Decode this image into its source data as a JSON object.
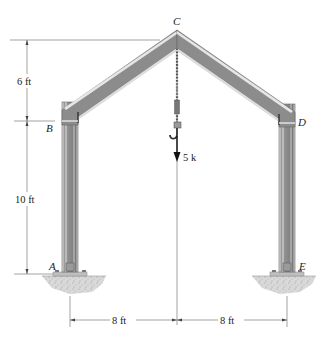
{
  "diagram": {
    "type": "structural-frame",
    "points": {
      "A": {
        "label": "A"
      },
      "B": {
        "label": "B"
      },
      "C": {
        "label": "C"
      },
      "D": {
        "label": "D"
      },
      "E": {
        "label": "E"
      }
    },
    "load": {
      "label": "5 k",
      "direction": "down"
    },
    "dimensions": {
      "roof_rise": "6 ft",
      "column_height": "10 ft",
      "left_span": "8 ft",
      "right_span": "8 ft"
    },
    "colors": {
      "beam_fill": "#8e8e8e",
      "beam_light": "#c9c9c9",
      "beam_dark": "#5e5e5e",
      "dimension_line": "#555555",
      "ground": "#bdbdbd"
    }
  }
}
